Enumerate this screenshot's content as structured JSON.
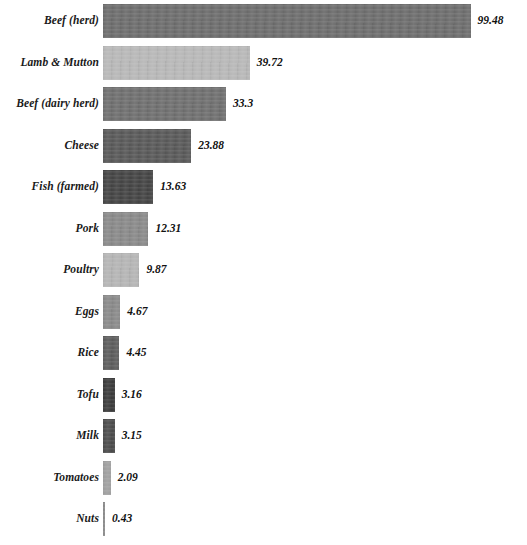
{
  "chart_data": {
    "type": "bar",
    "orientation": "horizontal",
    "title": "",
    "subtitle": "",
    "xlabel": "",
    "ylabel": "",
    "grid": false,
    "legend": "none",
    "axis_visible": false,
    "tick_labels": [],
    "xlim": [
      0,
      99.48
    ],
    "value_label_format": "trailing-zero-trimmed",
    "categories": [
      "Beef (herd)",
      "Lamb & Mutton",
      "Beef (dairy herd)",
      "Cheese",
      "Fish (farmed)",
      "Pork",
      "Poultry",
      "Eggs",
      "Rice",
      "Tofu",
      "Milk",
      "Tomatoes",
      "Nuts"
    ],
    "values": [
      99.48,
      39.72,
      33.3,
      23.88,
      13.63,
      12.31,
      9.87,
      4.67,
      4.45,
      3.16,
      3.15,
      2.09,
      0.43
    ],
    "value_labels": [
      "99.48",
      "39.72",
      "33.3",
      "23.88",
      "13.63",
      "12.31",
      "9.87",
      "4.67",
      "4.45",
      "3.16",
      "3.15",
      "2.09",
      "0.43"
    ],
    "bar_colors": [
      "#6e6e6e",
      "#b8b8b8",
      "#707070",
      "#5a5a5a",
      "#464646",
      "#8a8a8a",
      "#b5b5b5",
      "#8a8a8a",
      "#5e5e5e",
      "#3e3e3e",
      "#4e4e4e",
      "#a0a0a0",
      "#8e8e8e"
    ]
  },
  "layout": {
    "plot_left_px": 103,
    "px_per_unit": 3.695,
    "row_height_px": 41.5,
    "bar_height_px": 34,
    "first_row_top_px": 4
  }
}
